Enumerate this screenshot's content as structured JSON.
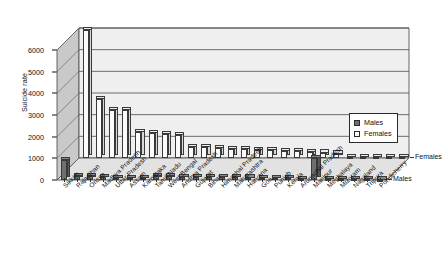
{
  "chart_data": {
    "type": "bar",
    "title": "",
    "xlabel": "",
    "ylabel": "Suicide rate",
    "ylim": [
      0,
      6000
    ],
    "yticks": [
      0,
      1000,
      2000,
      3000,
      4000,
      5000,
      6000
    ],
    "grid": true,
    "projection": "3d",
    "legend_position": "right",
    "depth_axis_labels": [
      "Females",
      "Males"
    ],
    "categories": [
      "Sikkim",
      "Rajasthan",
      "Orissa",
      "Madhya Pradesh",
      "Uttar Pradesh",
      "Assam",
      "Karnataka",
      "Tamil Nadu",
      "West Bengal",
      "Andhra Pradesh",
      "Gujarat",
      "Bihar",
      "Himachal Pradesh",
      "Maharashtra",
      "Haryana",
      "Goa",
      "Punjab",
      "Kerala",
      "Arunachal Pradesh",
      "Manipur",
      "Meghalaya",
      "Mizoram",
      "Nagaland",
      "Tripura",
      "Pondicherry"
    ],
    "series": [
      {
        "name": "Males",
        "color": "#6f6f6f",
        "values": [
          900,
          185,
          170,
          120,
          95,
          90,
          80,
          175,
          165,
          150,
          140,
          130,
          120,
          115,
          110,
          100,
          95,
          90,
          60,
          1000,
          40,
          35,
          30,
          25,
          20
        ]
      },
      {
        "name": "Females",
        "color": "#fbfbfb",
        "values": [
          5900,
          2700,
          2200,
          2200,
          1200,
          1150,
          1100,
          1050,
          520,
          500,
          470,
          420,
          400,
          380,
          350,
          330,
          300,
          280,
          250,
          200,
          60,
          50,
          45,
          35,
          25
        ]
      }
    ]
  },
  "legend": {
    "items": [
      {
        "label": "Males",
        "swatch": "filled-gray"
      },
      {
        "label": "Females",
        "swatch": "white"
      }
    ]
  }
}
